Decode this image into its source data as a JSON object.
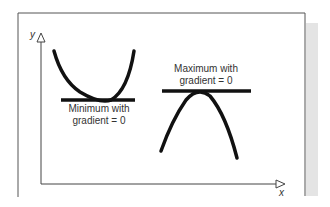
{
  "diagram": {
    "axes": {
      "x_label": "x",
      "y_label": "y"
    },
    "annotations": [
      {
        "id": "minimum",
        "line1": "Minimum with",
        "line2": "gradient = 0"
      },
      {
        "id": "maximum",
        "line1": "Maximum with",
        "line2": "gradient = 0"
      }
    ],
    "colors": {
      "curve": "#111111",
      "frame": "#555555",
      "shadow": "#e6e6e6",
      "text": "#333333"
    }
  }
}
